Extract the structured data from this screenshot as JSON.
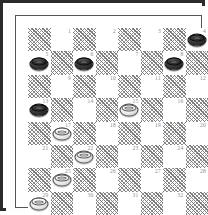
{
  "board": {
    "name": "draughts-board",
    "variant": "checkers",
    "rows": 8,
    "cols": 8,
    "numbered_squares": 32,
    "colors": {
      "frame": "#2b2b2b",
      "inner_frame": "#555555",
      "light_square": "#ffffff",
      "dark_square_hatch": "#7a7a7a",
      "number_text": "#8c8c8c",
      "black_piece": "#151515",
      "white_piece": "#ffffff"
    },
    "square_numbers": [
      1,
      2,
      3,
      4,
      5,
      6,
      7,
      8,
      9,
      10,
      11,
      12,
      13,
      14,
      15,
      16,
      17,
      18,
      19,
      20,
      21,
      22,
      23,
      24,
      25,
      26,
      27,
      28,
      29,
      30,
      31,
      32
    ],
    "pieces": [
      {
        "square": 4,
        "color": "black",
        "king": false
      },
      {
        "square": 5,
        "color": "black",
        "king": false
      },
      {
        "square": 6,
        "color": "black",
        "king": false
      },
      {
        "square": 8,
        "color": "black",
        "king": false
      },
      {
        "square": 13,
        "color": "black",
        "king": false
      },
      {
        "square": 15,
        "color": "white",
        "king": false
      },
      {
        "square": 17,
        "color": "white",
        "king": false
      },
      {
        "square": 22,
        "color": "white",
        "king": false
      },
      {
        "square": 25,
        "color": "white",
        "king": false
      },
      {
        "square": 29,
        "color": "white",
        "king": false
      }
    ],
    "counts": {
      "black": 5,
      "white": 5
    }
  }
}
